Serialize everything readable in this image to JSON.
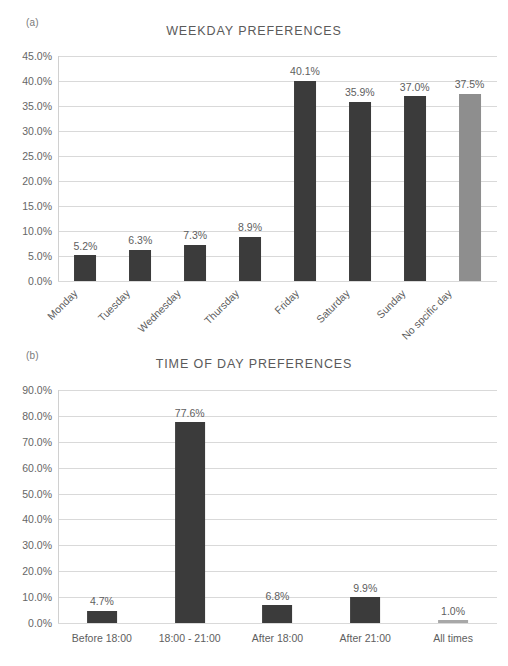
{
  "figure": {
    "background": "#ffffff",
    "bar_color_primary": "#3b3b3b",
    "bar_color_secondary": "#8e8e8e",
    "gridline_color": "#d9d9d9",
    "text_color": "#5e5e5e"
  },
  "panels": [
    {
      "tag": "(a)",
      "title": "WEEKDAY PREFERENCES"
    },
    {
      "tag": "(b)",
      "title": "TIME OF DAY PREFERENCES"
    }
  ],
  "chart_data": [
    {
      "type": "bar",
      "panel": "(a)",
      "title": "WEEKDAY PREFERENCES",
      "xlabel": "",
      "ylabel": "",
      "ylim": [
        0,
        45
      ],
      "ytick_labels": [
        "0.0%",
        "5.0%",
        "10.0%",
        "15.0%",
        "20.0%",
        "25.0%",
        "30.0%",
        "35.0%",
        "40.0%",
        "45.0%"
      ],
      "ytick_values": [
        0,
        5,
        10,
        15,
        20,
        25,
        30,
        35,
        40,
        45
      ],
      "grid": true,
      "legend": "none",
      "categories": [
        "Monday",
        "Tuesday",
        "Wednesday",
        "Thursday",
        "Friday",
        "Saturday",
        "Sunday",
        "No spcific day"
      ],
      "values": [
        5.2,
        6.3,
        7.3,
        8.9,
        40.1,
        35.9,
        37.0,
        37.5
      ],
      "data_labels": [
        "5.2%",
        "6.3%",
        "7.3%",
        "8.9%",
        "40.1%",
        "35.9%",
        "37.0%",
        "37.5%"
      ],
      "bar_colors": [
        "#3b3b3b",
        "#3b3b3b",
        "#3b3b3b",
        "#3b3b3b",
        "#3b3b3b",
        "#3b3b3b",
        "#3b3b3b",
        "#8e8e8e"
      ],
      "xtick_rotation": -45
    },
    {
      "type": "bar",
      "panel": "(b)",
      "title": "TIME OF DAY PREFERENCES",
      "xlabel": "",
      "ylabel": "",
      "ylim": [
        0,
        90
      ],
      "ytick_labels": [
        "0.0%",
        "10.0%",
        "20.0%",
        "30.0%",
        "40.0%",
        "50.0%",
        "60.0%",
        "70.0%",
        "80.0%",
        "90.0%"
      ],
      "ytick_values": [
        0,
        10,
        20,
        30,
        40,
        50,
        60,
        70,
        80,
        90
      ],
      "grid": true,
      "legend": "none",
      "categories": [
        "Before 18:00",
        "18:00 - 21:00",
        "After 18:00",
        "After 21:00",
        "All times"
      ],
      "values": [
        4.7,
        77.6,
        6.8,
        9.9,
        1.0
      ],
      "data_labels": [
        "4.7%",
        "77.6%",
        "6.8%",
        "9.9%",
        "1.0%"
      ],
      "bar_colors": [
        "#3b3b3b",
        "#3b3b3b",
        "#3b3b3b",
        "#3b3b3b",
        "#a8a8a8"
      ],
      "xtick_rotation": 0
    }
  ]
}
